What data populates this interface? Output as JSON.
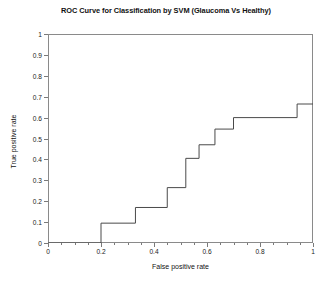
{
  "chart_data": {
    "type": "line",
    "title": "ROC Curve for Classification by SVM (Glaucoma Vs Healthy)",
    "xlabel": "False positive rate",
    "ylabel": "True positive rate",
    "xlim": [
      0,
      1
    ],
    "ylim": [
      0,
      1
    ],
    "grid": false,
    "legend": null,
    "line_style": "step-post",
    "line_color": "#4a4a4a",
    "background_color": "#ffffff",
    "axis_color": "#8a8a8a",
    "x_ticks": [
      0,
      0.2,
      0.4,
      0.6,
      0.8,
      1
    ],
    "x_tick_labels": [
      "0",
      "0.2",
      "0.4",
      "0.6",
      "0.8",
      "1"
    ],
    "x_minor_ticks": [
      0.05,
      0.1,
      0.15,
      0.25,
      0.3,
      0.35,
      0.45,
      0.5,
      0.55,
      0.65,
      0.7,
      0.75,
      0.85,
      0.9,
      0.95
    ],
    "y_ticks": [
      0,
      0.1,
      0.2,
      0.3,
      0.4,
      0.5,
      0.6,
      0.7,
      0.8,
      0.9,
      1
    ],
    "y_tick_labels": [
      "0",
      "0.1",
      "0.2",
      "0.3",
      "0.4",
      "0.5",
      "0.6",
      "0.7",
      "0.8",
      "0.9",
      "1"
    ],
    "series": [
      {
        "name": "ROC (SVM)",
        "x": [
          0,
          0.2,
          0.2,
          0.33,
          0.33,
          0.45,
          0.45,
          0.52,
          0.52,
          0.57,
          0.57,
          0.63,
          0.63,
          0.7,
          0.7,
          0.94,
          0.94,
          1.0
        ],
        "y": [
          0,
          0.0,
          0.095,
          0.095,
          0.17,
          0.17,
          0.265,
          0.265,
          0.405,
          0.405,
          0.47,
          0.47,
          0.545,
          0.545,
          0.6,
          0.6,
          0.665,
          0.665
        ]
      }
    ],
    "vertices": [
      {
        "x": 0.0,
        "y": 0.0
      },
      {
        "x": 0.2,
        "y": 0.0
      },
      {
        "x": 0.2,
        "y": 0.095
      },
      {
        "x": 0.33,
        "y": 0.095
      },
      {
        "x": 0.33,
        "y": 0.17
      },
      {
        "x": 0.45,
        "y": 0.17
      },
      {
        "x": 0.45,
        "y": 0.265
      },
      {
        "x": 0.52,
        "y": 0.265
      },
      {
        "x": 0.52,
        "y": 0.405
      },
      {
        "x": 0.57,
        "y": 0.405
      },
      {
        "x": 0.57,
        "y": 0.47
      },
      {
        "x": 0.63,
        "y": 0.47
      },
      {
        "x": 0.63,
        "y": 0.545
      },
      {
        "x": 0.7,
        "y": 0.545
      },
      {
        "x": 0.7,
        "y": 0.6
      },
      {
        "x": 0.94,
        "y": 0.6
      },
      {
        "x": 0.94,
        "y": 0.665
      },
      {
        "x": 1.0,
        "y": 0.665
      }
    ]
  }
}
